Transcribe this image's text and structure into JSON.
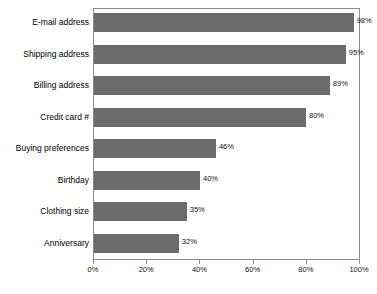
{
  "chart_data": {
    "type": "bar",
    "orientation": "horizontal",
    "title": "",
    "xlabel": "",
    "ylabel": "",
    "categories": [
      "E-mail address",
      "Shipping address",
      "Billing address",
      "Credit card #",
      "Buying preferences",
      "Birthday",
      "Clothing size",
      "Anniversary"
    ],
    "values": [
      98,
      95,
      89,
      80,
      46,
      40,
      35,
      32
    ],
    "value_labels": [
      "98%",
      "95%",
      "89%",
      "80%",
      "46%",
      "40%",
      "35%",
      "32%"
    ],
    "xlim": [
      0,
      100
    ],
    "xticks": [
      0,
      20,
      40,
      60,
      80,
      100
    ],
    "xtick_labels": [
      "0%",
      "20%",
      "40%",
      "60%",
      "80%",
      "100%"
    ],
    "grid": false,
    "legend": null,
    "bar_color": "#6b6b6b",
    "frame_color": "#8c8c8c",
    "text_color": "#000000"
  },
  "footer": {
    "caption_remnant": " "
  }
}
